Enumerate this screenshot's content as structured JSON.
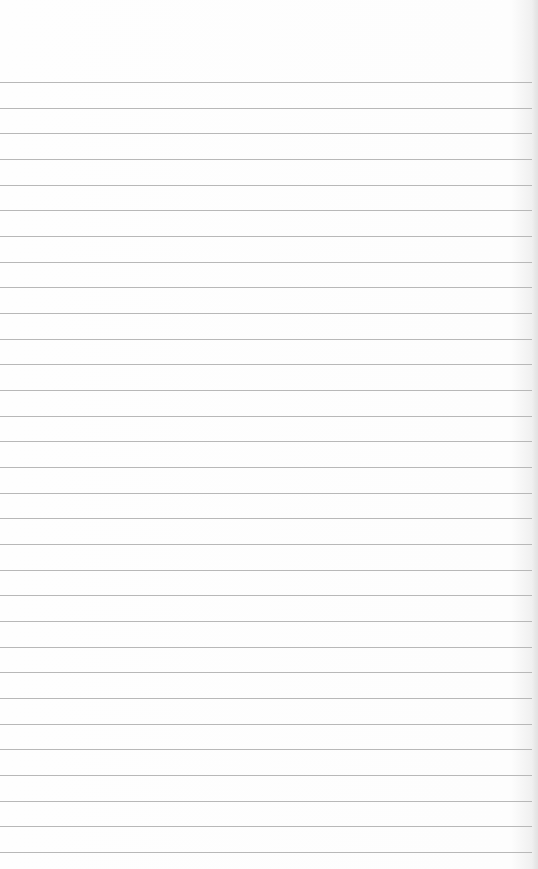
{
  "page": {
    "type": "blank ruled notebook paper",
    "background_color": "#fdfdfd",
    "rule_color": "#b8b8b8",
    "first_rule_y": 82,
    "rule_spacing": 25.67,
    "rule_count": 31,
    "text_content": ""
  }
}
